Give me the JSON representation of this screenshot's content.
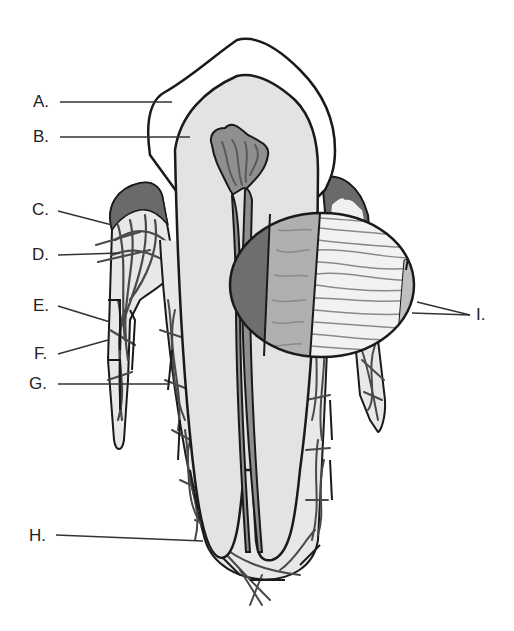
{
  "figure": {
    "labels": {
      "A": "A.",
      "B": "B.",
      "C": "C.",
      "D": "D.",
      "E": "E.",
      "F": "F.",
      "G": "G.",
      "H": "H.",
      "I": "I."
    },
    "colors": {
      "outline": "#1a1a1a",
      "enamel": "#ffffff",
      "dentin": "#e3e3e3",
      "pulp": "#8f8f8f",
      "pulp_vessels": "#5a5a5a",
      "gingiva_dark": "#6a6a6a",
      "bone_fill": "#e8e8e8",
      "fibers": "#4a4a4a",
      "inset_dark": "#6e6e6e",
      "inset_mid": "#b0b0b0",
      "inset_light": "#f2f2f2"
    }
  }
}
